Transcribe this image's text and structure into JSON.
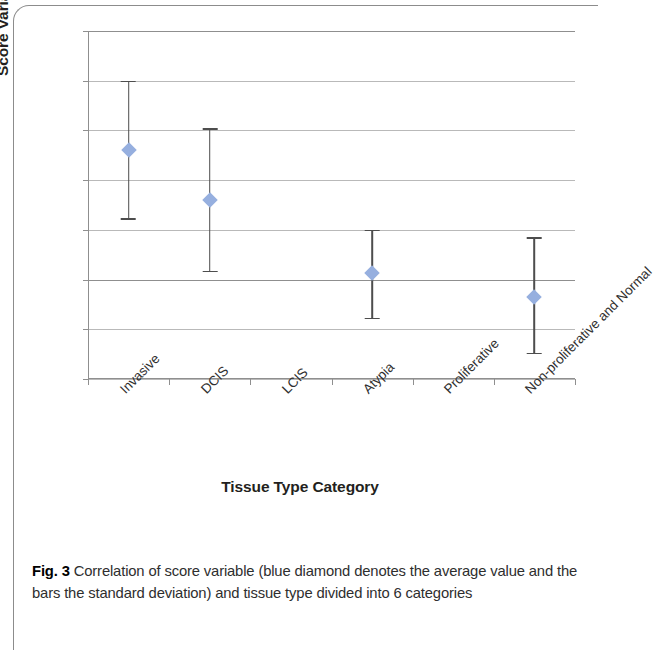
{
  "figure": {
    "label": "Fig. 3",
    "caption": "Correlation of score variable (blue diamond denotes the average value and the bars the standard deviation) and tissue type divided into 6 categories"
  },
  "chart_data": {
    "type": "scatter",
    "title": "",
    "xlabel": "Tissue Type Category",
    "ylabel": "Score Variable (a.u.)",
    "categories": [
      "Invasive",
      "DCIS",
      "LCIS",
      "Atypia",
      "Proliferative",
      "Non-proliferative and Normal"
    ],
    "values": [
      2.6,
      1.6,
      null,
      0.13,
      null,
      -0.35
    ],
    "error_low": [
      1.2,
      0.15,
      null,
      -0.8,
      null,
      -1.5
    ],
    "error_high": [
      4.0,
      3.05,
      null,
      1.0,
      null,
      0.85
    ],
    "error_bars": "standard deviation",
    "ylim": [
      -2,
      5
    ],
    "yticks": [
      5,
      4,
      3,
      2,
      1,
      0,
      -1,
      -2
    ],
    "ytick_labels": [
      "5",
      "4",
      "3",
      "2",
      "1",
      "0",
      "-1",
      "-2"
    ],
    "grid": true,
    "legend": false,
    "marker_color": "#96afdf",
    "errorbar_color": "#4d4d4d",
    "gridline_color": "#b9b9b9"
  }
}
